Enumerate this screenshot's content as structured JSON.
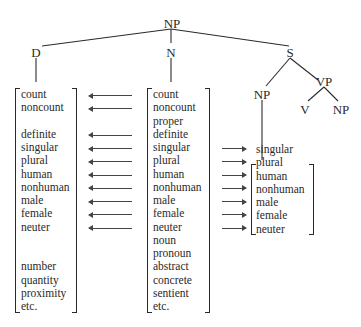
{
  "tree": {
    "root": "NP",
    "d": "D",
    "n": "N",
    "s": "S",
    "s_np": "NP",
    "vp": "VP",
    "v": "V",
    "vp_np": "NP"
  },
  "columns": {
    "determiner_features": [
      {
        "slot": 0,
        "label": "count"
      },
      {
        "slot": 1,
        "label": "noncount"
      },
      {
        "slot": 3,
        "label": "definite"
      },
      {
        "slot": 4,
        "label": "singular"
      },
      {
        "slot": 5,
        "label": "plural"
      },
      {
        "slot": 6,
        "label": "human"
      },
      {
        "slot": 7,
        "label": "nonhuman"
      },
      {
        "slot": 8,
        "label": "male"
      },
      {
        "slot": 9,
        "label": "female"
      },
      {
        "slot": 10,
        "label": "neuter"
      },
      {
        "slot": 13,
        "label": "number"
      },
      {
        "slot": 14,
        "label": "quantity"
      },
      {
        "slot": 15,
        "label": "proximity"
      },
      {
        "slot": 16,
        "label": "etc."
      }
    ],
    "noun_features": [
      {
        "slot": 0,
        "label": "count"
      },
      {
        "slot": 1,
        "label": "noncount"
      },
      {
        "slot": 2,
        "label": "proper"
      },
      {
        "slot": 3,
        "label": "definite"
      },
      {
        "slot": 4,
        "label": "singular"
      },
      {
        "slot": 5,
        "label": "plural"
      },
      {
        "slot": 6,
        "label": "human"
      },
      {
        "slot": 7,
        "label": "nonhuman"
      },
      {
        "slot": 8,
        "label": "male"
      },
      {
        "slot": 9,
        "label": "female"
      },
      {
        "slot": 10,
        "label": "neuter"
      },
      {
        "slot": 11,
        "label": "noun"
      },
      {
        "slot": 12,
        "label": "pronoun"
      },
      {
        "slot": 13,
        "label": "abstract"
      },
      {
        "slot": 14,
        "label": "concrete"
      },
      {
        "slot": 15,
        "label": "sentient"
      },
      {
        "slot": 16,
        "label": "etc."
      }
    ],
    "subject_np_features": [
      {
        "slot": 5,
        "label": "singular"
      },
      {
        "slot": 6,
        "label": "plural"
      },
      {
        "slot": 7,
        "label": "human"
      },
      {
        "slot": 8,
        "label": "nonhuman"
      },
      {
        "slot": 9,
        "label": "male"
      },
      {
        "slot": 10,
        "label": "female"
      },
      {
        "slot": 11,
        "label": "neuter"
      }
    ]
  },
  "arrows": {
    "left_slots": [
      0,
      1,
      3,
      4,
      5,
      6,
      7,
      8,
      9,
      10
    ],
    "right_slots": [
      4,
      5,
      6,
      7,
      8,
      9,
      10
    ]
  }
}
